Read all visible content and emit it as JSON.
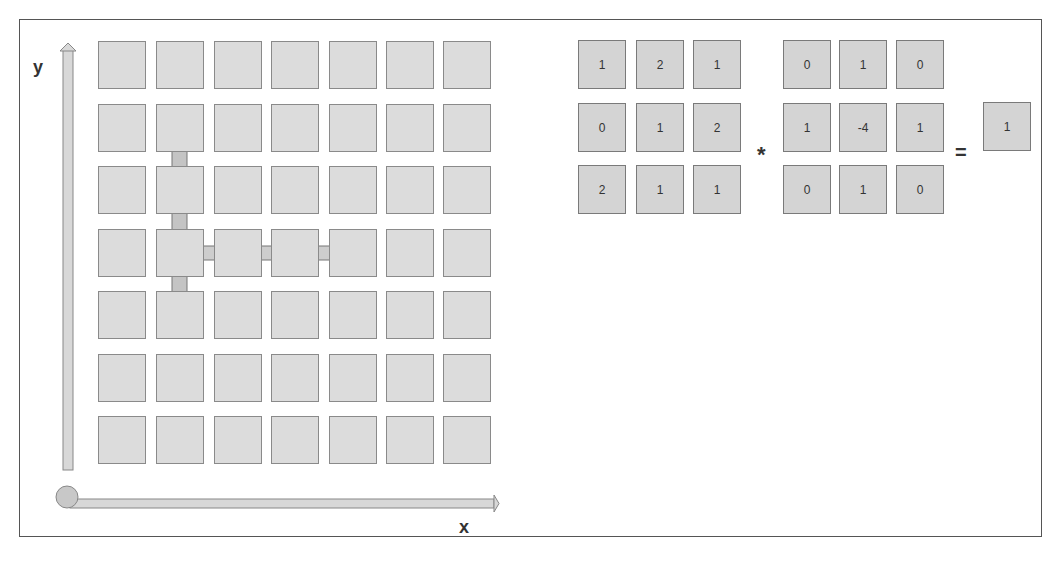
{
  "diagram": {
    "axes": {
      "x_label": "x",
      "y_label": "y"
    },
    "grid": {
      "rows": 7,
      "cols": 7
    },
    "arrows": [
      {
        "name": "vertical-derivative-arrow",
        "direction": "down"
      },
      {
        "name": "horizontal-derivative-arrow",
        "direction": "right"
      }
    ],
    "equation": {
      "input_matrix": [
        [
          "1",
          "2",
          "1"
        ],
        [
          "0",
          "1",
          "2"
        ],
        [
          "2",
          "1",
          "1"
        ]
      ],
      "operator": "*",
      "kernel": [
        [
          "0",
          "1",
          "0"
        ],
        [
          "1",
          "-4",
          "1"
        ],
        [
          "0",
          "1",
          "0"
        ]
      ],
      "equals": "=",
      "result": "1"
    }
  }
}
